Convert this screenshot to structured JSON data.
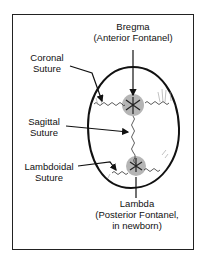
{
  "diagram": {
    "labels": {
      "bregma": {
        "line1": "Bregma",
        "line2": "(Anterior Fontanel)"
      },
      "coronal": {
        "line1": "Coronal",
        "line2": "Suture"
      },
      "sagittal": {
        "line1": "Sagittal",
        "line2": "Suture"
      },
      "lambdoidal": {
        "line1": "Lambdoidal",
        "line2": "Suture"
      },
      "lambda": {
        "line1": "Lambda",
        "line2": "(Posterior Fontanel,",
        "line3": "in newborn)"
      }
    },
    "colors": {
      "outline": "#111111",
      "fontanel_fill": "#b5b5b5",
      "frame": "#222222"
    }
  }
}
